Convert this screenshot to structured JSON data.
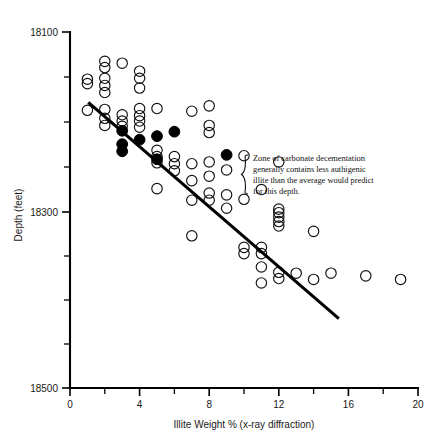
{
  "chart_data": {
    "type": "scatter",
    "title": "",
    "xlabel": "Illite Weight % (x-ray diffraction)",
    "ylabel": "Depth (feet)",
    "xlim": [
      0,
      20
    ],
    "ylim": [
      18500,
      18100
    ],
    "y_inverted": true,
    "grid": false,
    "legend": "none",
    "x_ticks": [
      0,
      4,
      8,
      12,
      16,
      20
    ],
    "x_tick_labels": [
      "0",
      "4",
      "8",
      "12",
      "16",
      "20"
    ],
    "x_minor_ticks": [
      2,
      6,
      10,
      14,
      18
    ],
    "y_ticks": [
      18100,
      18300,
      18500
    ],
    "y_tick_labels": [
      "18100",
      "18300",
      "18500"
    ],
    "y_minor_ticks": [
      18150,
      18200,
      18250,
      18350,
      18400,
      18450
    ],
    "series": [
      {
        "name": "open-circles",
        "marker": "open-circle",
        "color": "#111111",
        "points": [
          [
            1.0,
            18153
          ],
          [
            1.0,
            18158
          ],
          [
            1.0,
            18188
          ],
          [
            2.0,
            18133
          ],
          [
            2.0,
            18140
          ],
          [
            2.0,
            18152
          ],
          [
            2.0,
            18160
          ],
          [
            2.0,
            18168
          ],
          [
            2.0,
            18187
          ],
          [
            2.0,
            18197
          ],
          [
            2.0,
            18205
          ],
          [
            3.0,
            18135
          ],
          [
            3.0,
            18193
          ],
          [
            3.0,
            18200
          ],
          [
            3.0,
            18206
          ],
          [
            4.0,
            18144
          ],
          [
            4.0,
            18152
          ],
          [
            4.0,
            18163
          ],
          [
            4.0,
            18186
          ],
          [
            4.0,
            18194
          ],
          [
            4.0,
            18200
          ],
          [
            4.0,
            18207
          ],
          [
            5.0,
            18186
          ],
          [
            5.0,
            18233
          ],
          [
            5.0,
            18240
          ],
          [
            5.0,
            18247
          ],
          [
            5.0,
            18276
          ],
          [
            6.0,
            18240
          ],
          [
            6.0,
            18248
          ],
          [
            6.0,
            18256
          ],
          [
            7.0,
            18189
          ],
          [
            7.0,
            18248
          ],
          [
            7.0,
            18267
          ],
          [
            7.0,
            18289
          ],
          [
            7.0,
            18329
          ],
          [
            8.0,
            18183
          ],
          [
            8.0,
            18205
          ],
          [
            8.0,
            18213
          ],
          [
            8.0,
            18246
          ],
          [
            8.0,
            18262
          ],
          [
            8.0,
            18281
          ],
          [
            8.0,
            18289
          ],
          [
            9.0,
            18255
          ],
          [
            9.0,
            18283
          ],
          [
            9.0,
            18298
          ],
          [
            10.0,
            18239
          ],
          [
            10.0,
            18288
          ],
          [
            10.0,
            18342
          ],
          [
            10.0,
            18349
          ],
          [
            11.0,
            18277
          ],
          [
            11.0,
            18342
          ],
          [
            11.0,
            18349
          ],
          [
            11.0,
            18364
          ],
          [
            11.0,
            18382
          ],
          [
            12.0,
            18246
          ],
          [
            12.0,
            18299
          ],
          [
            12.0,
            18303
          ],
          [
            12.0,
            18308
          ],
          [
            12.0,
            18313
          ],
          [
            12.0,
            18318
          ],
          [
            12.0,
            18370
          ],
          [
            12.0,
            18377
          ],
          [
            13.0,
            18371
          ],
          [
            14.0,
            18324
          ],
          [
            14.0,
            18378
          ],
          [
            15.0,
            18371
          ],
          [
            17.0,
            18374
          ],
          [
            19.0,
            18378
          ]
        ]
      },
      {
        "name": "filled-circles",
        "marker": "filled-circle",
        "color": "#000000",
        "points": [
          [
            3.0,
            18211
          ],
          [
            3.0,
            18226
          ],
          [
            3.0,
            18234
          ],
          [
            4.0,
            18221
          ],
          [
            5.0,
            18217
          ],
          [
            5.0,
            18243
          ],
          [
            6.0,
            18212
          ],
          [
            9.0,
            18238
          ]
        ]
      }
    ],
    "trend_line": {
      "name": "regression-line",
      "x_start": 1.05,
      "y_start": 18179,
      "x_end": 15.45,
      "y_end": 18422,
      "color": "#000000"
    },
    "annotation": {
      "name": "decementation-note",
      "brace": "{",
      "lines": [
        "Zone of carbonate decementation",
        "generally contains less authigenic",
        "illite than the average would predict",
        "for this depth."
      ]
    }
  }
}
